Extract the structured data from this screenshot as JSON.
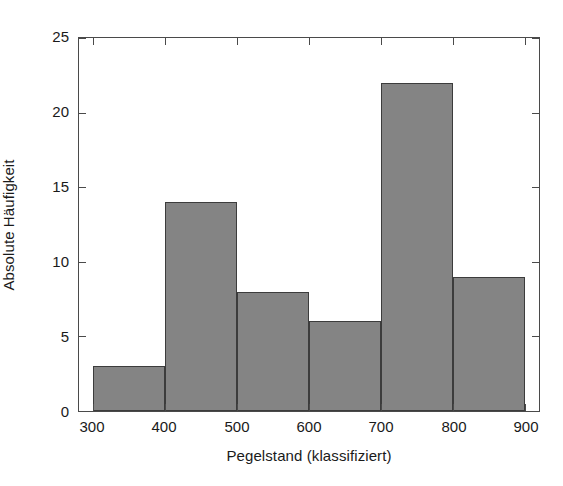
{
  "chart_data": {
    "type": "bar",
    "title": "",
    "subtitle": "",
    "xlabel": "Pegelstand (klassifiziert)",
    "ylabel": "Absolute Häufigkeit",
    "categories": [
      "300-400",
      "400-500",
      "500-600",
      "600-700",
      "700-800",
      "800-900"
    ],
    "bin_edges": [
      300,
      400,
      500,
      600,
      700,
      800,
      900
    ],
    "values": [
      3,
      14,
      8,
      6,
      22,
      9
    ],
    "xlim": [
      280,
      920
    ],
    "ylim": [
      0,
      25
    ],
    "xticks": [
      300,
      400,
      500,
      600,
      700,
      800,
      900
    ],
    "yticks": [
      0,
      5,
      10,
      15,
      20,
      25
    ],
    "xtick_labels": [
      "300",
      "400",
      "500",
      "600",
      "700",
      "800",
      "900"
    ],
    "ytick_labels": [
      "0",
      "5",
      "10",
      "15",
      "20",
      "25"
    ],
    "grid": false,
    "legend": null,
    "legend_position": "none",
    "annotations": [],
    "bar_fill_color": "#848484",
    "bar_edge_color": "#3c3c3c",
    "axis_color": "#4a4a4a",
    "background_color": "#ffffff",
    "text_color": "#1a1a1a"
  }
}
